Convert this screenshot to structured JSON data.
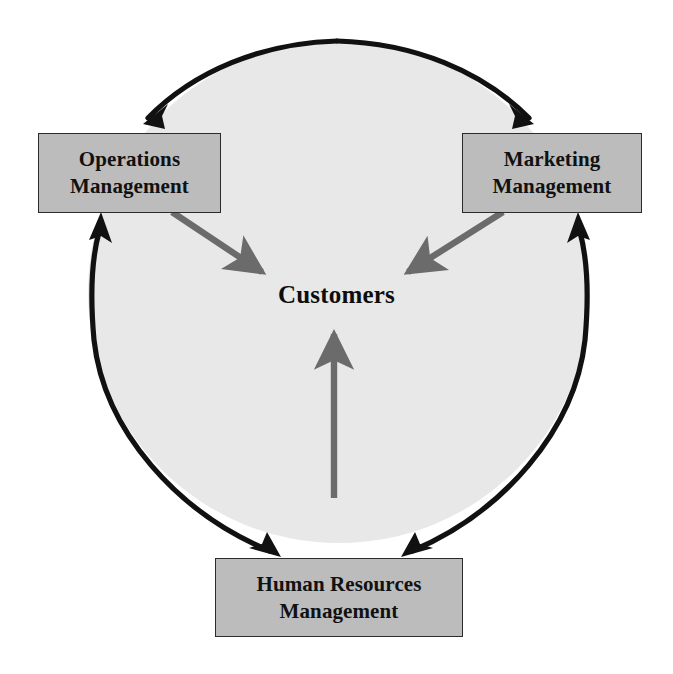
{
  "diagram": {
    "title": "Customers",
    "center_label": "Customers",
    "nodes": [
      {
        "id": "operations",
        "line1": "Operations",
        "line2": "Management",
        "position": "top-left"
      },
      {
        "id": "marketing",
        "line1": "Marketing",
        "line2": "Management",
        "position": "top-right"
      },
      {
        "id": "human-resources",
        "line1": "Human Resources",
        "line2": "Management",
        "position": "bottom-center"
      }
    ],
    "connectors": [
      {
        "id": "arc-top-left",
        "kind": "black-arc",
        "from": "top-of-circle",
        "to": "operations"
      },
      {
        "id": "arc-top-right",
        "kind": "black-arc",
        "from": "top-of-circle",
        "to": "marketing"
      },
      {
        "id": "arc-left",
        "kind": "black-arc",
        "from": "human-resources",
        "to": "operations"
      },
      {
        "id": "arc-right",
        "kind": "black-arc",
        "from": "human-resources",
        "to": "marketing"
      },
      {
        "id": "arrow-operations-to-customers",
        "kind": "gray-arrow",
        "from": "operations",
        "to": "customers"
      },
      {
        "id": "arrow-marketing-to-customers",
        "kind": "gray-arrow",
        "from": "marketing",
        "to": "customers"
      },
      {
        "id": "arrow-hr-to-customers",
        "kind": "gray-arrow",
        "from": "human-resources",
        "to": "customers"
      }
    ],
    "colors": {
      "circle_fill": "#e8e8e8",
      "circle_stroke": "#111111",
      "box_fill": "#bcbcbc",
      "box_stroke": "#2b2b2b",
      "gray_arrow": "#6b6b6b",
      "text": "#111111",
      "background": "#ffffff"
    }
  }
}
